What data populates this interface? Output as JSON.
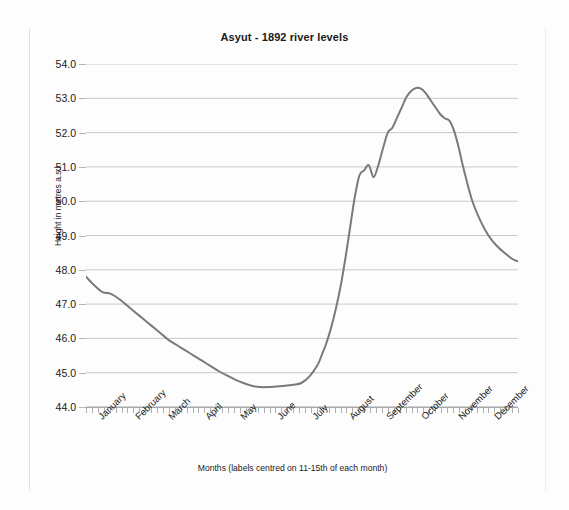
{
  "chart_data": {
    "type": "line",
    "title": "Asyut - 1892 river levels",
    "xlabel": "Months (labels centred on 11-15th of each month)",
    "ylabel": "Height in metres a.s.l.",
    "ylim": [
      44.0,
      54.0
    ],
    "y_ticks": [
      "44.0",
      "45.0",
      "46.0",
      "47.0",
      "48.0",
      "49.0",
      "50.0",
      "51.0",
      "52.0",
      "53.0",
      "54.0"
    ],
    "x_tick_labels": [
      "January",
      "February",
      "March",
      "April",
      "May",
      "June",
      "July",
      "August",
      "September",
      "October",
      "November",
      "December"
    ],
    "grid": "horizontal",
    "legend": "none",
    "line_color": "#7a7a7a",
    "series": [
      {
        "name": "Asyut river level 1892",
        "units": "metres a.s.l.",
        "x_unit": "day of year",
        "x": [
          1,
          8,
          15,
          22,
          29,
          36,
          43,
          50,
          57,
          64,
          71,
          78,
          85,
          92,
          99,
          106,
          113,
          120,
          127,
          134,
          141,
          148,
          155,
          162,
          169,
          176,
          183,
          190,
          197,
          200,
          204,
          208,
          212,
          216,
          220,
          224,
          228,
          232,
          236,
          240,
          244,
          248,
          252,
          256,
          260,
          264,
          268,
          272,
          276,
          280,
          284,
          288,
          292,
          296,
          300,
          304,
          308,
          312,
          316,
          320,
          327,
          334,
          341,
          348,
          355,
          362,
          366
        ],
        "values": [
          47.8,
          47.55,
          47.35,
          47.3,
          47.15,
          46.95,
          46.75,
          46.55,
          46.35,
          46.15,
          45.95,
          45.8,
          45.65,
          45.5,
          45.35,
          45.2,
          45.05,
          44.92,
          44.8,
          44.7,
          44.62,
          44.58,
          44.58,
          44.6,
          44.62,
          44.65,
          44.7,
          44.9,
          45.25,
          45.5,
          45.85,
          46.3,
          46.85,
          47.5,
          48.3,
          49.2,
          50.1,
          50.75,
          50.9,
          51.05,
          50.7,
          51.05,
          51.55,
          52.0,
          52.15,
          52.45,
          52.75,
          53.05,
          53.22,
          53.3,
          53.28,
          53.15,
          52.95,
          52.75,
          52.55,
          52.42,
          52.35,
          52.05,
          51.55,
          50.95,
          50.05,
          49.45,
          49.0,
          48.7,
          48.48,
          48.3,
          48.25
        ]
      }
    ],
    "annotations": {
      "minimum": {
        "value": 44.58,
        "period": "early June"
      },
      "maximum": {
        "value": 53.3,
        "period": "late September"
      },
      "flood_notch": {
        "value": 50.7,
        "period": "mid August"
      }
    }
  }
}
